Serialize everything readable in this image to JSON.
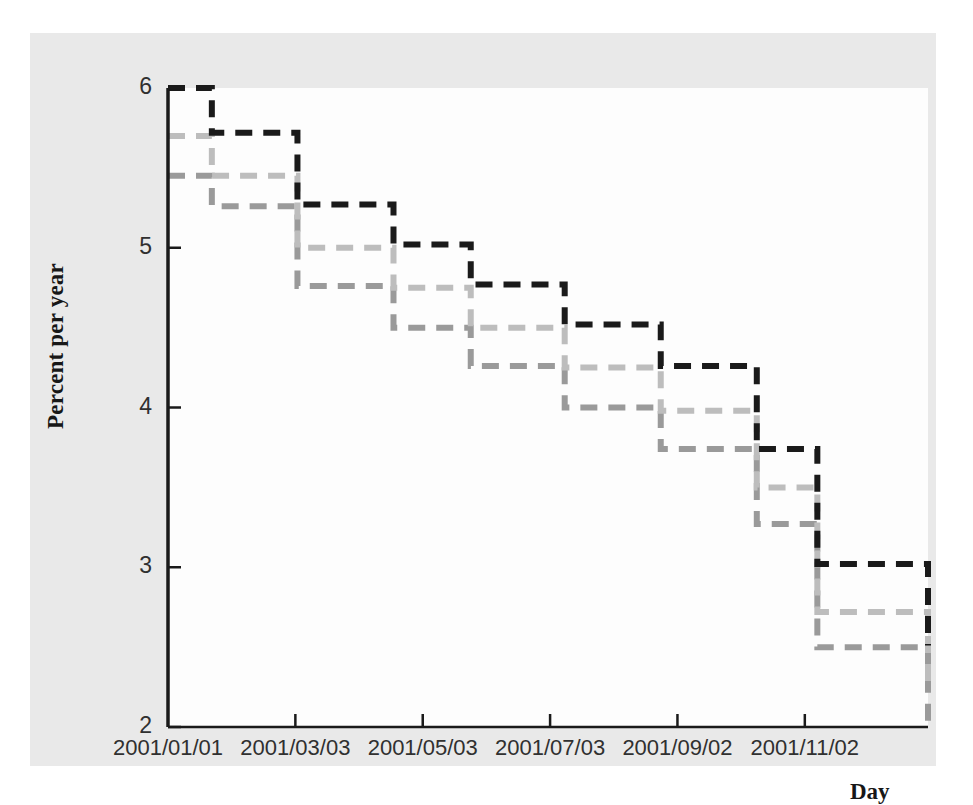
{
  "chart_data": {
    "type": "line",
    "title": "",
    "subtitle": "",
    "xlabel": "Day",
    "ylabel": "Percent per year",
    "xlim": [
      "2001/01/01",
      "2001/12/31"
    ],
    "ylim": [
      2,
      6
    ],
    "yticks": [
      2,
      3,
      4,
      5,
      6
    ],
    "ytick_labels": [
      "2",
      "3",
      "4",
      "5",
      "6"
    ],
    "xticks": [
      "2001/01/01",
      "2001/03/03",
      "2001/05/03",
      "2001/07/03",
      "2001/09/02",
      "2001/11/02"
    ],
    "xtick_labels": [
      "2001/01/01",
      "2001/03/03",
      "2001/05/03",
      "2001/07/03",
      "2001/09/02",
      "2001/11/02"
    ],
    "grid": false,
    "legend": "none",
    "step_style": "post",
    "line_style": "dashed",
    "series": [
      {
        "name": "series-dark",
        "color": "#1a1a1a",
        "x": [
          "2001/01/01",
          "2001/01/22",
          "2001/03/04",
          "2001/04/19",
          "2001/05/26",
          "2001/07/10",
          "2001/08/25",
          "2001/10/10",
          "2001/11/08",
          "2001/12/31"
        ],
        "values": [
          6.0,
          5.72,
          5.27,
          5.02,
          4.77,
          4.52,
          4.26,
          3.74,
          3.02,
          2.51
        ]
      },
      {
        "name": "series-light-gray",
        "color": "#bdbdbd",
        "x": [
          "2001/01/01",
          "2001/01/22",
          "2001/03/04",
          "2001/04/19",
          "2001/05/26",
          "2001/07/10",
          "2001/08/25",
          "2001/10/10",
          "2001/11/08",
          "2001/12/31"
        ],
        "values": [
          5.7,
          5.45,
          5.0,
          4.75,
          4.5,
          4.25,
          3.98,
          3.5,
          2.72,
          2.22
        ]
      },
      {
        "name": "series-mid-gray",
        "color": "#9a9a9a",
        "x": [
          "2001/01/01",
          "2001/01/22",
          "2001/03/04",
          "2001/04/19",
          "2001/05/26",
          "2001/07/10",
          "2001/08/25",
          "2001/10/10",
          "2001/11/08",
          "2001/12/31"
        ],
        "values": [
          5.45,
          5.26,
          4.76,
          4.5,
          4.26,
          4.0,
          3.74,
          3.27,
          2.5,
          2.01
        ]
      }
    ]
  },
  "figure": {
    "background_color": "#e9e9e9",
    "panel_color": "#fdfdfd",
    "axis_color": "#1a1a1a"
  }
}
